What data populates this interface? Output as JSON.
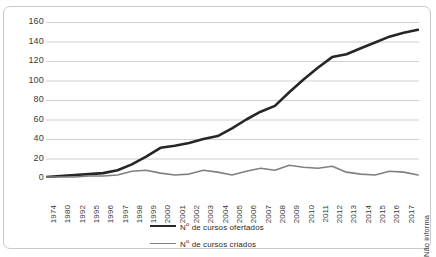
{
  "chart_data": {
    "type": "line",
    "title": "",
    "subtitle": "",
    "xlabel": "",
    "ylabel": "",
    "ylim": [
      0,
      160
    ],
    "yticks": [
      0,
      20,
      40,
      60,
      80,
      100,
      120,
      140,
      160
    ],
    "grid": true,
    "legend_position": "bottom",
    "categories": [
      "1974",
      "1980",
      "1992",
      "1995",
      "1996",
      "1997",
      "1998",
      "1999",
      "2000",
      "2001",
      "2002",
      "2003",
      "2004",
      "2005",
      "2006",
      "2007",
      "2008",
      "2009",
      "2010",
      "2011",
      "2012",
      "2013",
      "2014",
      "2015",
      "2016",
      "2017",
      "Não informa"
    ],
    "series": [
      {
        "name": "Nº de cursos ofertados",
        "color": "#262626",
        "width": 2.6,
        "values": [
          1,
          2,
          3,
          4,
          5,
          8,
          14,
          22,
          31,
          33,
          36,
          40,
          43,
          51,
          60,
          68,
          74,
          88,
          101,
          113,
          124,
          127,
          133,
          139,
          145,
          149,
          152
        ]
      },
      {
        "name": "Nº de cursos criados",
        "color": "#808080",
        "width": 1.6,
        "values": [
          1,
          1,
          1,
          2,
          2,
          3,
          7,
          8,
          5,
          3,
          4,
          8,
          6,
          3,
          7,
          10,
          8,
          13,
          11,
          10,
          12,
          6,
          4,
          3,
          7,
          6,
          3
        ]
      }
    ]
  },
  "legend": {
    "items": [
      {
        "label_prefix": "N",
        "label_sup": "o",
        "label_rest": " de cursos ofertados"
      },
      {
        "label_prefix": "N",
        "label_sup": "o",
        "label_rest": " de cursos criados"
      }
    ]
  },
  "colors": {
    "series_dark": "#262626",
    "series_gray": "#808080",
    "gridline": "#d0d0d0",
    "frame": "#c9c9c9",
    "text": "#3a3a3a",
    "background": "#ffffff"
  }
}
